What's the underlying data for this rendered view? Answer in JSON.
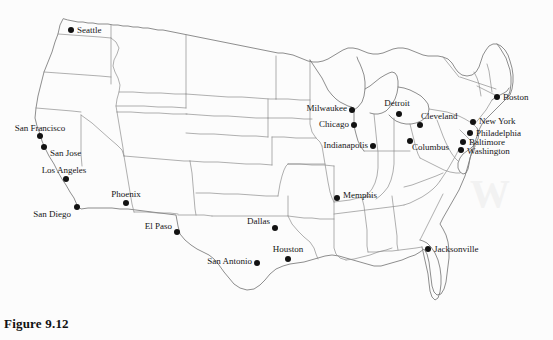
{
  "figure": {
    "caption": "Figure 9.12",
    "background_color": "#fcfcfc",
    "boundary_color": "#8e8e8e",
    "marker_color": "#121212",
    "label_color": "#161616"
  },
  "scan_artifacts": {
    "top_ghost_text": "",
    "right_ghost_text": "W",
    "bottom_ghost_text": ""
  },
  "map": {
    "region": "Contiguous United States",
    "cities": [
      {
        "name": "Seattle",
        "x": 71,
        "y": 30,
        "label_x": 77,
        "label_y": 30,
        "anchor": "lbl-right"
      },
      {
        "name": "San Francisco",
        "x": 40,
        "y": 136,
        "label_x": 40,
        "label_y": 133,
        "anchor": "lbl-above"
      },
      {
        "name": "San Jose",
        "x": 44,
        "y": 147,
        "label_x": 50,
        "label_y": 153,
        "anchor": "lbl-right"
      },
      {
        "name": "Los Angeles",
        "x": 66,
        "y": 179,
        "label_x": 64,
        "label_y": 175,
        "anchor": "lbl-above"
      },
      {
        "name": "San Diego",
        "x": 77,
        "y": 207,
        "label_x": 71,
        "label_y": 214,
        "anchor": "lbl-left"
      },
      {
        "name": "Phoenix",
        "x": 126,
        "y": 203,
        "label_x": 126,
        "label_y": 199,
        "anchor": "lbl-above"
      },
      {
        "name": "El Paso",
        "x": 177,
        "y": 232,
        "label_x": 172,
        "label_y": 226,
        "anchor": "lbl-left"
      },
      {
        "name": "Dallas",
        "x": 275,
        "y": 228,
        "label_x": 270,
        "label_y": 221,
        "anchor": "lbl-left"
      },
      {
        "name": "San Antonio",
        "x": 257,
        "y": 263,
        "label_x": 252,
        "label_y": 261,
        "anchor": "lbl-left"
      },
      {
        "name": "Houston",
        "x": 288,
        "y": 259,
        "label_x": 288,
        "label_y": 254,
        "anchor": "lbl-above"
      },
      {
        "name": "Memphis",
        "x": 337,
        "y": 198,
        "label_x": 343,
        "label_y": 195,
        "anchor": "lbl-right"
      },
      {
        "name": "Milwaukee",
        "x": 352,
        "y": 110,
        "label_x": 347,
        "label_y": 108,
        "anchor": "lbl-left"
      },
      {
        "name": "Chicago",
        "x": 354,
        "y": 125,
        "label_x": 349,
        "label_y": 124,
        "anchor": "lbl-left"
      },
      {
        "name": "Indianapolis",
        "x": 373,
        "y": 146,
        "label_x": 368,
        "label_y": 145,
        "anchor": "lbl-left"
      },
      {
        "name": "Detroit",
        "x": 399,
        "y": 114,
        "label_x": 397,
        "label_y": 108,
        "anchor": "lbl-above"
      },
      {
        "name": "Cleveland",
        "x": 420,
        "y": 125,
        "label_x": 421,
        "label_y": 116,
        "anchor": "lbl-right"
      },
      {
        "name": "Columbus",
        "x": 410,
        "y": 141,
        "label_x": 412,
        "label_y": 147,
        "anchor": "lbl-right"
      },
      {
        "name": "New York",
        "x": 473,
        "y": 122,
        "label_x": 479,
        "label_y": 121,
        "anchor": "lbl-right"
      },
      {
        "name": "Philadelphia",
        "x": 470,
        "y": 133,
        "label_x": 476,
        "label_y": 133,
        "anchor": "lbl-right"
      },
      {
        "name": "Baltimore",
        "x": 463,
        "y": 142,
        "label_x": 469,
        "label_y": 142,
        "anchor": "lbl-right"
      },
      {
        "name": "Washington",
        "x": 461,
        "y": 150,
        "label_x": 467,
        "label_y": 151,
        "anchor": "lbl-right"
      },
      {
        "name": "Boston",
        "x": 497,
        "y": 97,
        "label_x": 503,
        "label_y": 97,
        "anchor": "lbl-right"
      },
      {
        "name": "Jacksonville",
        "x": 428,
        "y": 249,
        "label_x": 434,
        "label_y": 249,
        "anchor": "lbl-right"
      }
    ]
  }
}
